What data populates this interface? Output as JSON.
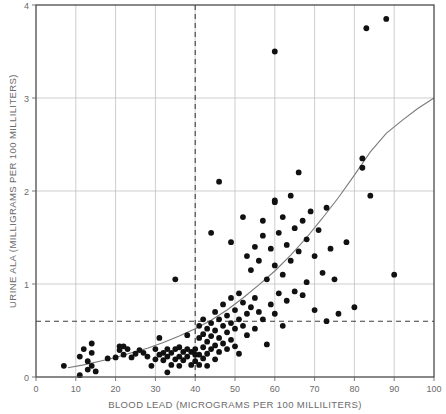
{
  "chart_data": {
    "type": "scatter",
    "title": "",
    "xlabel": "BLOOD LEAD (MICROGRAMS PER 100 MILLILITERS)",
    "ylabel": "URINE ALA (MILLIGRAMS PER 100 MILLILITERS)",
    "xlim": [
      0,
      100
    ],
    "ylim": [
      0,
      4
    ],
    "xticks": [
      0,
      10,
      20,
      30,
      40,
      50,
      60,
      70,
      80,
      90,
      100
    ],
    "yticks": [
      0,
      1,
      2,
      3,
      4
    ],
    "xtick_labels": [
      "0",
      "10",
      "20",
      "30",
      "40",
      "50",
      "60",
      "70",
      "80",
      "90",
      "100"
    ],
    "ytick_labels": [
      "0",
      "1",
      "2",
      "3",
      "4"
    ],
    "grid": true,
    "grid_color": "#b9b9b9",
    "legend": null,
    "point_color": "#111111",
    "curve_color": "#7a7a7a",
    "reference_lines": [
      {
        "name": "vertical-threshold",
        "orientation": "vertical",
        "value": 40,
        "style": "dashed",
        "color": "#3d3d3d"
      },
      {
        "name": "horizontal-threshold",
        "orientation": "horizontal",
        "value": 0.6,
        "style": "dashed",
        "color": "#3d3d3d"
      }
    ],
    "fit_curve": {
      "name": "exponential-fit",
      "description": "rising exponential fit reaching 3.0 at blood lead 100",
      "points": [
        [
          8,
          0.1
        ],
        [
          12,
          0.13
        ],
        [
          16,
          0.17
        ],
        [
          20,
          0.21
        ],
        [
          24,
          0.26
        ],
        [
          28,
          0.31
        ],
        [
          32,
          0.37
        ],
        [
          36,
          0.44
        ],
        [
          40,
          0.52
        ],
        [
          44,
          0.61
        ],
        [
          48,
          0.72
        ],
        [
          52,
          0.85
        ],
        [
          56,
          0.99
        ],
        [
          60,
          1.14
        ],
        [
          64,
          1.31
        ],
        [
          68,
          1.5
        ],
        [
          72,
          1.71
        ],
        [
          76,
          1.93
        ],
        [
          80,
          2.17
        ],
        [
          84,
          2.42
        ],
        [
          88,
          2.62
        ],
        [
          92,
          2.76
        ],
        [
          96,
          2.89
        ],
        [
          100,
          3.0
        ]
      ]
    },
    "points": [
      [
        7,
        0.12
      ],
      [
        11,
        0.02
      ],
      [
        11,
        0.22
      ],
      [
        12,
        0.3
      ],
      [
        13,
        0.17
      ],
      [
        13,
        0.08
      ],
      [
        14,
        0.36
      ],
      [
        14,
        0.26
      ],
      [
        14,
        0.12
      ],
      [
        15,
        0.06
      ],
      [
        18,
        0.2
      ],
      [
        20,
        0.21
      ],
      [
        21,
        0.33
      ],
      [
        21,
        0.29
      ],
      [
        22,
        0.33
      ],
      [
        22,
        0.24
      ],
      [
        23,
        0.3
      ],
      [
        24,
        0.21
      ],
      [
        25,
        0.25
      ],
      [
        26,
        0.29
      ],
      [
        27,
        0.26
      ],
      [
        28,
        0.22
      ],
      [
        29,
        0.12
      ],
      [
        30,
        0.3
      ],
      [
        30,
        0.19
      ],
      [
        31,
        0.42
      ],
      [
        31,
        0.24
      ],
      [
        32,
        0.26
      ],
      [
        32,
        0.18
      ],
      [
        33,
        0.22
      ],
      [
        33,
        0.3
      ],
      [
        33,
        0.05
      ],
      [
        34,
        0.13
      ],
      [
        34,
        0.26
      ],
      [
        35,
        0.3
      ],
      [
        35,
        0.19
      ],
      [
        36,
        0.32
      ],
      [
        36,
        0.22
      ],
      [
        36,
        0.12
      ],
      [
        37,
        0.27
      ],
      [
        37,
        0.18
      ],
      [
        38,
        0.45
      ],
      [
        38,
        0.3
      ],
      [
        38,
        0.22
      ],
      [
        39,
        0.27
      ],
      [
        39,
        0.13
      ],
      [
        40,
        0.3
      ],
      [
        40,
        0.24
      ],
      [
        40,
        0.17
      ],
      [
        35,
        1.05
      ],
      [
        41,
        0.55
      ],
      [
        41,
        0.42
      ],
      [
        41,
        0.24
      ],
      [
        41,
        0.13
      ],
      [
        42,
        0.62
      ],
      [
        42,
        0.46
      ],
      [
        42,
        0.32
      ],
      [
        42,
        0.2
      ],
      [
        43,
        0.52
      ],
      [
        43,
        0.38
      ],
      [
        43,
        0.25
      ],
      [
        43,
        0.12
      ],
      [
        44,
        0.58
      ],
      [
        44,
        0.44
      ],
      [
        44,
        0.3
      ],
      [
        45,
        0.7
      ],
      [
        45,
        0.5
      ],
      [
        45,
        0.34
      ],
      [
        45,
        0.19
      ],
      [
        46,
        0.62
      ],
      [
        46,
        0.42
      ],
      [
        46,
        0.27
      ],
      [
        47,
        0.78
      ],
      [
        47,
        0.55
      ],
      [
        47,
        0.36
      ],
      [
        48,
        0.66
      ],
      [
        48,
        0.48
      ],
      [
        48,
        0.3
      ],
      [
        49,
        0.85
      ],
      [
        49,
        0.58
      ],
      [
        49,
        0.4
      ],
      [
        50,
        0.72
      ],
      [
        50,
        0.52
      ],
      [
        50,
        0.33
      ],
      [
        51,
        0.9
      ],
      [
        51,
        0.62
      ],
      [
        51,
        0.25
      ],
      [
        52,
        0.8
      ],
      [
        52,
        0.55
      ],
      [
        53,
        1.3
      ],
      [
        53,
        0.68
      ],
      [
        53,
        0.45
      ],
      [
        54,
        1.15
      ],
      [
        54,
        0.75
      ],
      [
        55,
        1.4
      ],
      [
        55,
        0.85
      ],
      [
        55,
        0.52
      ],
      [
        56,
        1.25
      ],
      [
        56,
        0.7
      ],
      [
        57,
        1.52
      ],
      [
        57,
        0.62
      ],
      [
        58,
        1.05
      ],
      [
        58,
        0.35
      ],
      [
        59,
        1.38
      ],
      [
        59,
        0.78
      ],
      [
        60,
        3.5
      ],
      [
        60,
        1.9
      ],
      [
        60,
        1.88
      ],
      [
        60,
        1.2
      ],
      [
        60,
        0.68
      ],
      [
        61,
        1.55
      ],
      [
        61,
        0.9
      ],
      [
        62,
        1.72
      ],
      [
        62,
        1.1
      ],
      [
        62,
        0.55
      ],
      [
        63,
        1.42
      ],
      [
        63,
        0.82
      ],
      [
        64,
        1.95
      ],
      [
        64,
        1.25
      ],
      [
        65,
        1.6
      ],
      [
        65,
        0.92
      ],
      [
        66,
        2.2
      ],
      [
        66,
        1.35
      ],
      [
        67,
        1.68
      ],
      [
        67,
        0.88
      ],
      [
        68,
        1.48
      ],
      [
        68,
        1.02
      ],
      [
        69,
        1.78
      ],
      [
        70,
        1.3
      ],
      [
        70,
        0.72
      ],
      [
        71,
        1.58
      ],
      [
        72,
        1.12
      ],
      [
        73,
        1.82
      ],
      [
        73,
        0.6
      ],
      [
        74,
        1.38
      ],
      [
        75,
        1.05
      ],
      [
        76,
        0.68
      ],
      [
        78,
        1.45
      ],
      [
        80,
        0.75
      ],
      [
        82,
        2.35
      ],
      [
        82,
        2.25
      ],
      [
        83,
        3.75
      ],
      [
        84,
        1.95
      ],
      [
        88,
        3.85
      ],
      [
        90,
        1.1
      ],
      [
        46,
        2.1
      ],
      [
        52,
        1.72
      ],
      [
        57,
        1.68
      ],
      [
        44,
        1.55
      ],
      [
        49,
        1.45
      ]
    ]
  }
}
